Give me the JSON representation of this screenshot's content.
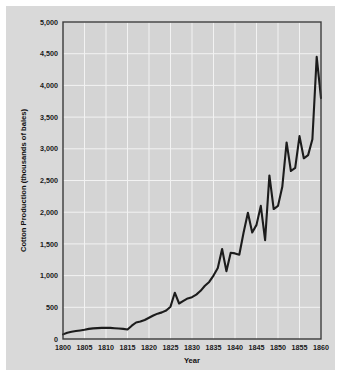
{
  "figure": {
    "background_color": "#d9d9d9",
    "plot_background_color": "#d4d4d4",
    "grid_color": "#f2f2f2",
    "line_color": "#1c1c1c",
    "border_color": "#3a3a3a"
  },
  "axes": {
    "x_title": "Year",
    "y_title": "Cotton Production (thousands of bales)",
    "x_tick_labels": [
      "1800",
      "1805",
      "1810",
      "1815",
      "1820",
      "1825",
      "1830",
      "1835",
      "1840",
      "1845",
      "1850",
      "1855",
      "1860"
    ],
    "y_tick_labels": [
      "0",
      "500",
      "1,000",
      "1,500",
      "2,000",
      "2,500",
      "3,000",
      "3,500",
      "4,000",
      "4,500",
      "5,000"
    ]
  },
  "chart_data": {
    "type": "line",
    "title": "",
    "xlabel": "Year",
    "ylabel": "Cotton Production (thousands of bales)",
    "xlim": [
      1800,
      1860
    ],
    "ylim": [
      0,
      5000
    ],
    "xticks": [
      1800,
      1805,
      1810,
      1815,
      1820,
      1825,
      1830,
      1835,
      1840,
      1845,
      1850,
      1855,
      1860
    ],
    "yticks": [
      0,
      500,
      1000,
      1500,
      2000,
      2500,
      3000,
      3500,
      4000,
      4500,
      5000
    ],
    "grid": true,
    "legend": "none",
    "series": [
      {
        "name": "Cotton Production",
        "x": [
          1800,
          1801,
          1802,
          1803,
          1804,
          1805,
          1806,
          1807,
          1808,
          1809,
          1810,
          1811,
          1812,
          1813,
          1814,
          1815,
          1816,
          1817,
          1818,
          1819,
          1820,
          1821,
          1822,
          1823,
          1824,
          1825,
          1826,
          1827,
          1828,
          1829,
          1830,
          1831,
          1832,
          1833,
          1834,
          1835,
          1836,
          1837,
          1838,
          1839,
          1840,
          1841,
          1842,
          1843,
          1844,
          1845,
          1846,
          1847,
          1848,
          1849,
          1850,
          1851,
          1852,
          1853,
          1854,
          1855,
          1856,
          1857,
          1858,
          1859,
          1860
        ],
        "values": [
          73,
          100,
          115,
          125,
          135,
          146,
          160,
          168,
          172,
          175,
          178,
          176,
          170,
          165,
          160,
          150,
          210,
          260,
          275,
          300,
          335,
          370,
          400,
          420,
          450,
          510,
          730,
          560,
          600,
          640,
          660,
          700,
          760,
          840,
          900,
          1000,
          1120,
          1420,
          1070,
          1360,
          1350,
          1330,
          1680,
          1990,
          1680,
          1800,
          2100,
          1560,
          2580,
          2050,
          2100,
          2400,
          3100,
          2650,
          2700,
          3200,
          2850,
          2900,
          3150,
          4450,
          3800
        ]
      }
    ]
  }
}
